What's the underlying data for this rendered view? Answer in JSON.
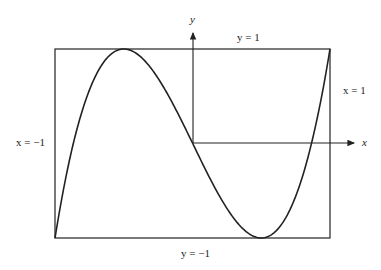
{
  "figure": {
    "labels": {
      "y_axis": "y",
      "x_axis": "x",
      "top": "y = 1",
      "bottom": "y = −1",
      "left": "x = −1",
      "right": "x = 1"
    },
    "curve": "cubic y = 4x³ − 3x on [−1, 1]",
    "colors": {
      "line": "#222222",
      "background": "#ffffff"
    }
  },
  "chart_data": {
    "type": "line",
    "title": "",
    "xlabel": "x",
    "ylabel": "y",
    "xlim": [
      -1,
      1
    ],
    "ylim": [
      -1,
      1
    ],
    "series": [
      {
        "name": "4x^3 - 3x",
        "x": [
          -1,
          -0.75,
          -0.5,
          -0.25,
          0,
          0.25,
          0.5,
          0.75,
          1
        ],
        "y": [
          -1,
          0.5625,
          1,
          0.6875,
          0,
          -0.6875,
          -1,
          -0.5625,
          1
        ]
      }
    ],
    "annotations": [
      "y = 1",
      "y = -1",
      "x = -1",
      "x = 1"
    ]
  }
}
